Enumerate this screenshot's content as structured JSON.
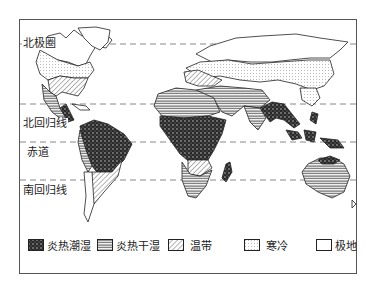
{
  "map": {
    "latitude_lines": [
      {
        "id": "arctic-circle",
        "label": "北极圈",
        "y": 44
      },
      {
        "id": "tropic-of-cancer",
        "label": "北回归线",
        "y": 104
      },
      {
        "id": "equator",
        "label": "赤道",
        "y": 142
      },
      {
        "id": "tropic-of-capricorn",
        "label": "南回归线",
        "y": 180
      }
    ]
  },
  "legend": {
    "items": [
      {
        "id": "tropical-humid",
        "label": "炎热潮湿",
        "pattern": "dense-dark"
      },
      {
        "id": "tropical-dry",
        "label": "炎热干湿",
        "pattern": "horizontal-lines"
      },
      {
        "id": "temperate",
        "label": "温带",
        "pattern": "diagonal-hatch"
      },
      {
        "id": "cold",
        "label": "寒冷",
        "pattern": "light-dots"
      },
      {
        "id": "polar",
        "label": "极地",
        "pattern": "blank"
      }
    ]
  },
  "colors": {
    "ink": "#222222",
    "line": "#888888",
    "background": "#ffffff"
  }
}
